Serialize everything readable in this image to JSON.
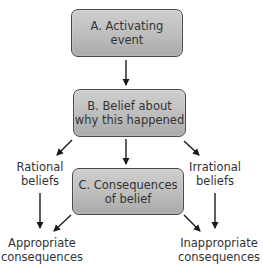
{
  "diagram": {
    "type": "flow-diagram",
    "colors": {
      "box_fill_top": "#cfcfcf",
      "box_fill_bottom": "#a9a9a9",
      "box_border": "#4a4a4a",
      "arrow": "#1a1a1a",
      "text": "#333333"
    },
    "boxes": {
      "a": {
        "label": "A.  Activating\nevent"
      },
      "b": {
        "label": "B.  Belief about\nwhy this happened"
      },
      "c": {
        "label": "C.  Consequences\nof belief"
      }
    },
    "labels": {
      "rational": "Rational\nbeliefs",
      "irrational": "Irrational\nbeliefs",
      "appropriate": "Appropriate\nconsequences",
      "inappropriate": "Inappropriate\nconsequences"
    },
    "edges": [
      {
        "from": "A. Activating event",
        "to": "B. Belief about why this happened"
      },
      {
        "from": "B. Belief about why this happened",
        "to": "C. Consequences of belief"
      },
      {
        "from": "B. Belief about why this happened",
        "to": "Rational beliefs"
      },
      {
        "from": "B. Belief about why this happened",
        "to": "Irrational beliefs"
      },
      {
        "from": "Rational beliefs",
        "to": "Appropriate consequences"
      },
      {
        "from": "Irrational beliefs",
        "to": "Inappropriate consequences"
      },
      {
        "from": "C. Consequences of belief",
        "to": "Appropriate consequences"
      },
      {
        "from": "C. Consequences of belief",
        "to": "Inappropriate consequences"
      }
    ]
  }
}
